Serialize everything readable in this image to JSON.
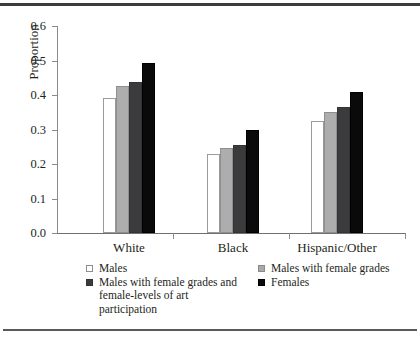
{
  "chart_data": {
    "type": "bar",
    "title": "",
    "xlabel": "",
    "ylabel": "Proportion",
    "ylim": [
      0.0,
      0.6
    ],
    "yticks": [
      "0.0",
      "0.1",
      "0.2",
      "0.3",
      "0.4",
      "0.5",
      "0.6"
    ],
    "ytick_values": [
      0.0,
      0.1,
      0.2,
      0.3,
      0.4,
      0.5,
      0.6
    ],
    "grid": false,
    "legend_position": "bottom",
    "categories": [
      "White",
      "Black",
      "Hispanic/Other"
    ],
    "series": [
      {
        "name": "Males",
        "color": "#ffffff",
        "values": [
          0.39,
          0.23,
          0.325
        ]
      },
      {
        "name": "Males with female grades",
        "color": "#adadad",
        "values": [
          0.425,
          0.245,
          0.35
        ]
      },
      {
        "name": "Males with female grades and female-levels of art participation",
        "color": "#3b3a3c",
        "values": [
          0.437,
          0.255,
          0.365
        ]
      },
      {
        "name": "Females",
        "color": "#0a0a0a",
        "values": [
          0.492,
          0.3,
          0.41
        ]
      }
    ]
  },
  "legend": {
    "entries": [
      {
        "label": "Males",
        "swatch": "s0"
      },
      {
        "label": "Males with female grades",
        "swatch": "s1"
      },
      {
        "label": "Males with female grades and female-levels of art participation",
        "swatch": "s2"
      },
      {
        "label": "Females",
        "swatch": "s3"
      }
    ]
  }
}
